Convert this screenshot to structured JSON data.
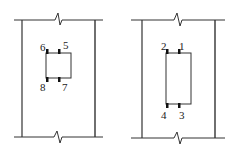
{
  "diagram": {
    "colors": {
      "line": "#333333",
      "tab": "#111111",
      "background": "#ffffff"
    },
    "panels": [
      {
        "id": "left",
        "labels": [
          {
            "text": "6",
            "x": 40,
            "y": 51
          },
          {
            "text": "5",
            "x": 63,
            "y": 49
          },
          {
            "text": "8",
            "x": 40,
            "y": 91
          },
          {
            "text": "7",
            "x": 62,
            "y": 91
          }
        ]
      },
      {
        "id": "right",
        "labels": [
          {
            "text": "2",
            "x": 161,
            "y": 50
          },
          {
            "text": "1",
            "x": 179,
            "y": 50
          },
          {
            "text": "4",
            "x": 161,
            "y": 119
          },
          {
            "text": "3",
            "x": 179,
            "y": 119
          }
        ]
      }
    ]
  }
}
